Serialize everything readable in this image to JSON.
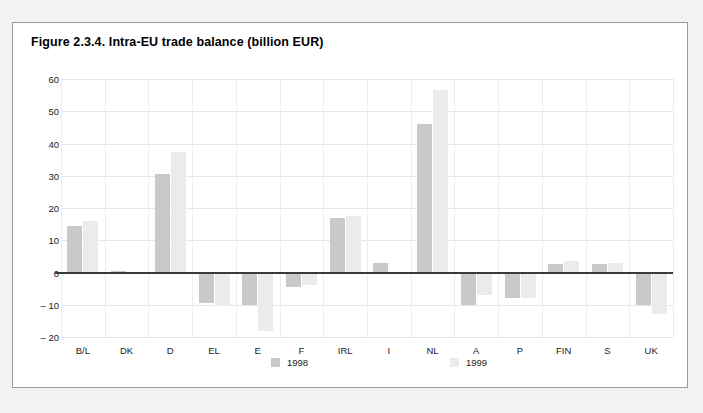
{
  "figure": {
    "title": "Figure 2.3.4. Intra-EU trade balance (billion EUR)"
  },
  "legend": {
    "items": [
      {
        "label": "1998",
        "color": "#c9c9c9"
      },
      {
        "label": "1999",
        "color": "#ebebeb"
      }
    ]
  },
  "chart_data": {
    "type": "bar",
    "title": "Figure 2.3.4. Intra-EU trade balance (billion EUR)",
    "xlabel": "",
    "ylabel": "",
    "ylim": [
      -20,
      60
    ],
    "yticks": [
      60,
      50,
      40,
      30,
      20,
      10,
      0,
      -10,
      -20
    ],
    "ytick_labels": [
      "60",
      "50",
      "40",
      "30",
      "20",
      "10",
      "0",
      "– 10",
      "– 20"
    ],
    "grid": true,
    "legend_position": "bottom",
    "units": "billion EUR",
    "categories": [
      "B/L",
      "DK",
      "D",
      "EL",
      "E",
      "F",
      "IRL",
      "I",
      "NL",
      "A",
      "P",
      "FIN",
      "S",
      "UK"
    ],
    "series": [
      {
        "name": "1998",
        "color": "#c9c9c9",
        "values": [
          14.5,
          0.5,
          30.5,
          -9.5,
          -10.0,
          -4.5,
          17.0,
          3.0,
          46.0,
          -10.0,
          -8.0,
          2.5,
          2.5,
          -10.0
        ]
      },
      {
        "name": "1999",
        "color": "#ebebeb",
        "values": [
          16.0,
          0.3,
          37.5,
          -10.5,
          -18.0,
          -4.0,
          17.5,
          0.3,
          56.5,
          -7.0,
          -8.0,
          3.5,
          3.0,
          -13.0
        ]
      }
    ]
  }
}
